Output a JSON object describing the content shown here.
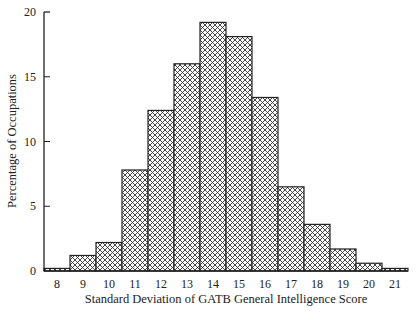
{
  "chart_data": {
    "type": "bar",
    "title": "",
    "xlabel": "Standard Deviation of GATB General Intelligence Score",
    "ylabel": "Percentage of Occupations",
    "categories": [
      "8",
      "9",
      "10",
      "11",
      "12",
      "13",
      "14",
      "15",
      "16",
      "17",
      "18",
      "19",
      "20",
      "21"
    ],
    "values": [
      0.2,
      1.2,
      2.2,
      7.8,
      12.4,
      16.0,
      19.2,
      18.1,
      13.4,
      6.5,
      3.6,
      1.7,
      0.6,
      0.2
    ],
    "ylim": [
      0,
      20
    ],
    "yticks": [
      0,
      5,
      10,
      15,
      20
    ],
    "grid": false,
    "legend": null,
    "bar_style": "cross-hatched, black outline, no gaps"
  },
  "colors": {
    "outline": "#222222",
    "hatch": "#333333",
    "background": "#ffffff"
  }
}
